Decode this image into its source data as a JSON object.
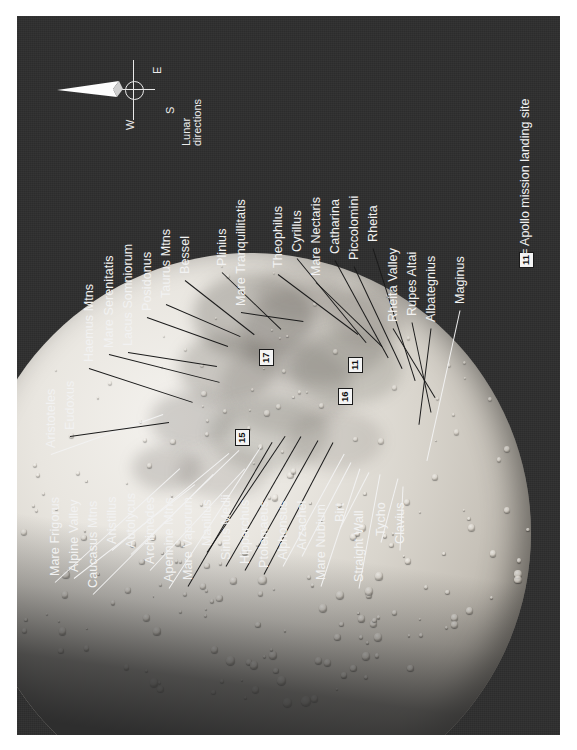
{
  "figure": {
    "kind": "annotated-lunar-map",
    "orientation_note": "page rotated 90 degrees counter-clockwise",
    "background_color": "#2e2e2e",
    "label_color": "#f2f2f2",
    "marker_color": "#f4f4f4"
  },
  "compass": {
    "caption": "Lunar directions",
    "west": "W",
    "east": "E",
    "south": "S"
  },
  "legend": {
    "marker": "11",
    "text": "= Apollo mission landing site"
  },
  "apollo_sites": [
    {
      "number": "11",
      "x": 331,
      "y": 357
    },
    {
      "number": "15",
      "x": 218,
      "y": 430
    },
    {
      "number": "16",
      "x": 321,
      "y": 389
    },
    {
      "number": "17",
      "x": 242,
      "y": 350
    }
  ],
  "labels": [
    {
      "text": "Aristoteles",
      "lx": 28,
      "ly": 432,
      "ex": 146,
      "ey": 398
    },
    {
      "text": "Eudoxus",
      "lx": 47,
      "ly": 414,
      "ex": 152,
      "ey": 406
    },
    {
      "text": "Haemus Mtns",
      "lx": 66,
      "ly": 346,
      "ex": 176,
      "ey": 386
    },
    {
      "text": "Mare Serenitatis",
      "lx": 86,
      "ly": 332,
      "ex": 203,
      "ey": 366
    },
    {
      "text": "Lacus Somniorum",
      "lx": 105,
      "ly": 330,
      "ex": 200,
      "ey": 350
    },
    {
      "text": "Posidonus",
      "lx": 124,
      "ly": 295,
      "ex": 211,
      "ey": 330
    },
    {
      "text": "Taurus Mtns",
      "lx": 143,
      "ly": 282,
      "ex": 223,
      "ey": 320
    },
    {
      "text": "Bessel",
      "lx": 162,
      "ly": 258,
      "ex": 237,
      "ey": 318
    },
    {
      "text": "Plinius",
      "lx": 199,
      "ly": 250,
      "ex": 264,
      "ey": 313
    },
    {
      "text": "Mare Tranquillitatis",
      "lx": 218,
      "ly": 290,
      "ex": 286,
      "ey": 305
    },
    {
      "text": "Theophilus",
      "lx": 255,
      "ly": 252,
      "ex": 341,
      "ey": 318
    },
    {
      "text": "Cyrillus",
      "lx": 274,
      "ly": 236,
      "ex": 349,
      "ey": 326
    },
    {
      "text": "Mare Nectaris",
      "lx": 293,
      "ly": 260,
      "ex": 365,
      "ey": 330
    },
    {
      "text": "Catharina",
      "lx": 312,
      "ly": 238,
      "ex": 371,
      "ey": 341
    },
    {
      "text": "Piccolomini",
      "lx": 331,
      "ly": 244,
      "ex": 385,
      "ey": 352
    },
    {
      "text": "Rheita",
      "lx": 350,
      "ly": 226,
      "ex": 398,
      "ey": 364
    },
    {
      "text": "Rheita Valley",
      "lx": 370,
      "ly": 306,
      "ex": 418,
      "ey": 381
    },
    {
      "text": "Rupes Altai",
      "lx": 389,
      "ly": 300,
      "ex": 414,
      "ey": 396
    },
    {
      "text": "Albategnius",
      "lx": 408,
      "ly": 306,
      "ex": 402,
      "ey": 408
    },
    {
      "text": "Maginus",
      "lx": 437,
      "ly": 288,
      "ex": 410,
      "ey": 444
    },
    {
      "text": "Mare Frigorus",
      "lx": 32,
      "ly": 560,
      "ex": 163,
      "ey": 452
    },
    {
      "text": "Alpine Valley",
      "lx": 51,
      "ly": 556,
      "ex": 178,
      "ey": 468
    },
    {
      "text": "Caucasus Mtns",
      "lx": 70,
      "ly": 572,
      "ex": 196,
      "ey": 458
    },
    {
      "text": "Aristillus",
      "lx": 89,
      "ly": 528,
      "ex": 212,
      "ey": 437
    },
    {
      "text": "Autolycus",
      "lx": 108,
      "ly": 532,
      "ex": 222,
      "ey": 434
    },
    {
      "text": "Archimedes",
      "lx": 127,
      "ly": 548,
      "ex": 228,
      "ey": 452
    },
    {
      "text": "Apennine Mtns",
      "lx": 146,
      "ly": 566,
      "ex": 244,
      "ey": 430
    },
    {
      "text": "Mare Vaporum",
      "lx": 165,
      "ly": 564,
      "ex": 255,
      "ey": 426
    },
    {
      "text": "Manilius",
      "lx": 184,
      "ly": 530,
      "ex": 268,
      "ey": 420
    },
    {
      "text": "Sinus Medii",
      "lx": 203,
      "ly": 544,
      "ex": 284,
      "ey": 420
    },
    {
      "text": "Hipparchus",
      "lx": 222,
      "ly": 548,
      "ex": 301,
      "ey": 424
    },
    {
      "text": "Ptolemaeus",
      "lx": 241,
      "ly": 552,
      "ex": 316,
      "ey": 426
    },
    {
      "text": "Alphonsus",
      "lx": 260,
      "ly": 544,
      "ex": 327,
      "ey": 438
    },
    {
      "text": "Arzachel",
      "lx": 279,
      "ly": 534,
      "ex": 334,
      "ey": 446
    },
    {
      "text": "Mare Nubium",
      "lx": 298,
      "ly": 564,
      "ex": 343,
      "ey": 452
    },
    {
      "text": "Birt",
      "lx": 317,
      "ly": 506,
      "ex": 352,
      "ey": 456
    },
    {
      "text": "Straight Wall",
      "lx": 336,
      "ly": 566,
      "ex": 363,
      "ey": 458
    },
    {
      "text": "Tycho",
      "lx": 358,
      "ly": 520,
      "ex": 381,
      "ey": 462
    },
    {
      "text": "Clavius",
      "lx": 377,
      "ly": 528,
      "ex": 386,
      "ey": 470
    }
  ]
}
